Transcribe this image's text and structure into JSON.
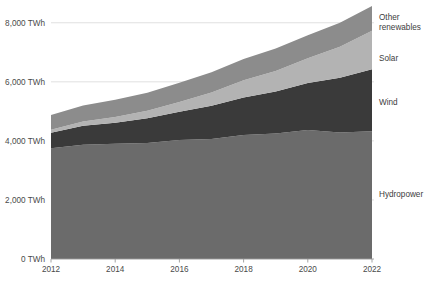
{
  "chart_data": {
    "type": "area",
    "stacked": true,
    "title": "",
    "subtitle": "",
    "xlabel": "",
    "ylabel": "",
    "x": [
      2012,
      2013,
      2014,
      2015,
      2016,
      2017,
      2018,
      2019,
      2020,
      2021,
      2022
    ],
    "xlim": [
      2012,
      2022
    ],
    "ylim": [
      0,
      8500
    ],
    "yticks": [
      0,
      2000,
      4000,
      6000,
      8000
    ],
    "ytick_labels": [
      "0 TWh",
      "2,000 TWh",
      "4,000 TWh",
      "6,000 TWh",
      "8,000 TWh"
    ],
    "xticks": [
      2012,
      2014,
      2016,
      2018,
      2020,
      2022
    ],
    "xtick_labels": [
      "2012",
      "2014",
      "2016",
      "2018",
      "2020",
      "2022"
    ],
    "grid": true,
    "grid_axis": "y",
    "legend_position": "inline-right",
    "unit": "TWh",
    "series": [
      {
        "name": "Hydropower",
        "color": "#6b6b6b",
        "label": "Hydropower",
        "label_value_y": 2100,
        "values": [
          3750,
          3870,
          3900,
          3930,
          4030,
          4060,
          4200,
          4250,
          4370,
          4280,
          4330
        ]
      },
      {
        "name": "Wind",
        "color": "#3a3a3a",
        "label": "Wind",
        "label_value_y": 5200,
        "values": [
          525,
          645,
          715,
          835,
          960,
          1130,
          1270,
          1420,
          1590,
          1860,
          2100
        ]
      },
      {
        "name": "Solar",
        "color": "#b3b3b3",
        "label": "Solar",
        "label_value_y": 6700,
        "values": [
          100,
          140,
          195,
          255,
          330,
          445,
          580,
          700,
          840,
          1050,
          1300
        ]
      },
      {
        "name": "Other renewables",
        "color": "#8c8c8c",
        "label": "Other renewables",
        "label_value_y": 7950,
        "values": [
          500,
          540,
          580,
          610,
          650,
          690,
          720,
          760,
          780,
          810,
          840
        ]
      }
    ],
    "totals": [
      4875,
      5195,
      5390,
      5630,
      5970,
      6325,
      6770,
      7130,
      7580,
      8000,
      8570
    ]
  },
  "labels": {
    "other_renewables_line1": "Other",
    "other_renewables_line2": "renewables",
    "solar": "Solar",
    "wind": "Wind",
    "hydropower": "Hydropower"
  },
  "colors": {
    "background": "#ffffff",
    "grid": "#d8d8d8",
    "axis": "#9a9a9a",
    "tick_text": "#4a4a4a",
    "label_text": "#3d3d3d"
  }
}
